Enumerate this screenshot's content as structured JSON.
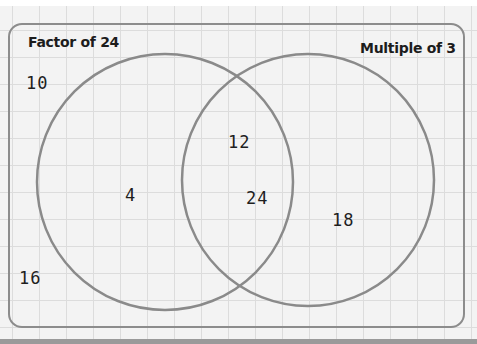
{
  "diagram": {
    "type": "venn",
    "sets": [
      {
        "id": "left",
        "label": "Factor of 24",
        "only_values": [
          "4"
        ]
      },
      {
        "id": "right",
        "label": "Multiple of 3",
        "only_values": [
          "18"
        ]
      }
    ],
    "intersection_values": [
      "12",
      "24"
    ],
    "outside_values": [
      "10",
      "16"
    ],
    "colors": {
      "circle_stroke": "#8a8a8a",
      "frame_stroke": "#8c8c8c",
      "text": "#1e1e1e",
      "grid_line": "#dcdcdc",
      "background": "#f3f3f3"
    }
  },
  "labels": {
    "left": "Factor of 24",
    "right": "Multiple of 3"
  },
  "numbers": {
    "outside_top": "10",
    "outside_bottom": "16",
    "left_only": "4",
    "intersection_top": "12",
    "intersection_bottom": "24",
    "right_only": "18"
  }
}
